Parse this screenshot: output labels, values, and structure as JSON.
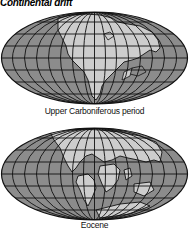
{
  "title": "Continental drift",
  "colors": {
    "ocean": "#8c8c8c",
    "land": "#cdcdcd",
    "grid": "#111111",
    "background": "#ffffff"
  },
  "maps": [
    {
      "caption": "Upper Carboniferous period",
      "projection": "elliptical (Mollweide-like) with meridians and parallels",
      "description": "Pangaea supercontinent; continents joined in a single mass"
    },
    {
      "caption": "Eocene",
      "projection": "elliptical (Mollweide-like) with meridians and parallels",
      "description": "Continents separating toward modern positions"
    }
  ]
}
